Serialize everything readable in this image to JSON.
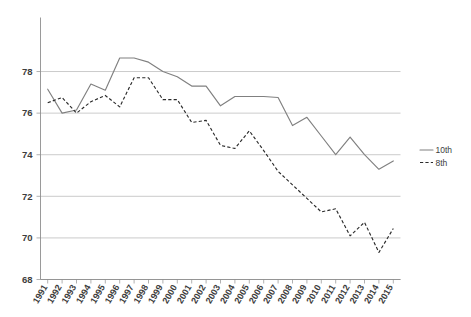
{
  "chart_data": {
    "type": "line",
    "title": "",
    "subtitle": "",
    "xlabel": "",
    "ylabel": "",
    "grid": "horizontal",
    "legend_position": "right",
    "ylim": [
      68,
      80.55
    ],
    "yticks": [
      68,
      70,
      72,
      74,
      76,
      78
    ],
    "ytick_labels": [
      "68",
      "70",
      "72",
      "74",
      "76",
      "78"
    ],
    "categories": [
      "1991",
      "1992",
      "1993",
      "1994",
      "1995",
      "1996",
      "1997",
      "1998",
      "1999",
      "2000",
      "2001",
      "2002",
      "2003",
      "2004",
      "2005",
      "2006",
      "2007",
      "2008",
      "2009",
      "2010",
      "2011",
      "2012",
      "2013",
      "2014",
      "2015"
    ],
    "series": [
      {
        "name": "10th",
        "style": "solid",
        "color": "#808080",
        "values": [
          77.15,
          76.0,
          76.15,
          77.4,
          77.1,
          78.65,
          78.65,
          78.45,
          78.0,
          77.75,
          77.3,
          77.3,
          76.35,
          76.8,
          76.8,
          76.8,
          76.75,
          75.4,
          75.8,
          74.9,
          74.0,
          74.85,
          74.0,
          73.3,
          73.7
        ]
      },
      {
        "name": "8th",
        "style": "dashed",
        "color": "#2b2b2b",
        "values": [
          76.5,
          76.75,
          76.0,
          76.55,
          76.85,
          76.3,
          77.7,
          77.7,
          76.65,
          76.65,
          75.55,
          75.65,
          74.45,
          74.3,
          75.15,
          74.2,
          73.2,
          72.55,
          71.9,
          71.25,
          71.4,
          70.1,
          70.75,
          69.3,
          70.45
        ]
      }
    ]
  },
  "legend": {
    "items": [
      {
        "label": "10th",
        "style": "solid"
      },
      {
        "label": "8th",
        "style": "dashed"
      }
    ]
  }
}
